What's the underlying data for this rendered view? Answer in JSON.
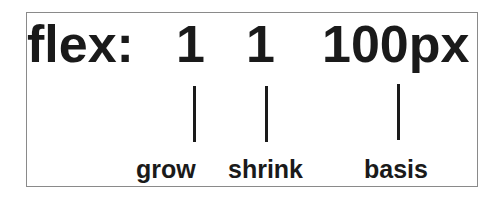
{
  "diagram": {
    "property": "flex:",
    "values": [
      {
        "text": "1",
        "label": "grow"
      },
      {
        "text": "1",
        "label": "shrink"
      },
      {
        "text": "100px",
        "label": "basis"
      }
    ]
  }
}
